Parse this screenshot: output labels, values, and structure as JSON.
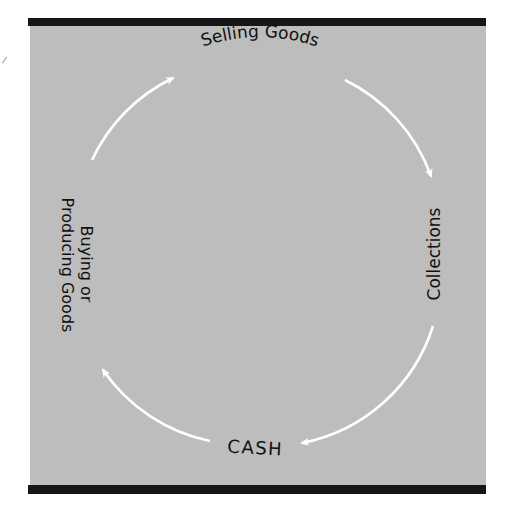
{
  "diagram": {
    "nodes": [
      {
        "id": "selling",
        "label": "Selling Goods"
      },
      {
        "id": "collections",
        "label": "Collections"
      },
      {
        "id": "cash",
        "label": "CASH"
      },
      {
        "id": "buying",
        "label_line1": "Buying or",
        "label_line2": "Producing Goods"
      }
    ],
    "edges": [
      {
        "from": "buying",
        "to": "selling"
      },
      {
        "from": "selling",
        "to": "collections"
      },
      {
        "from": "collections",
        "to": "cash"
      },
      {
        "from": "cash",
        "to": "buying"
      }
    ],
    "colors": {
      "panel": "#bdbdbd",
      "bars": "#161616",
      "arrows": "#ffffff",
      "text": "#111111"
    }
  }
}
